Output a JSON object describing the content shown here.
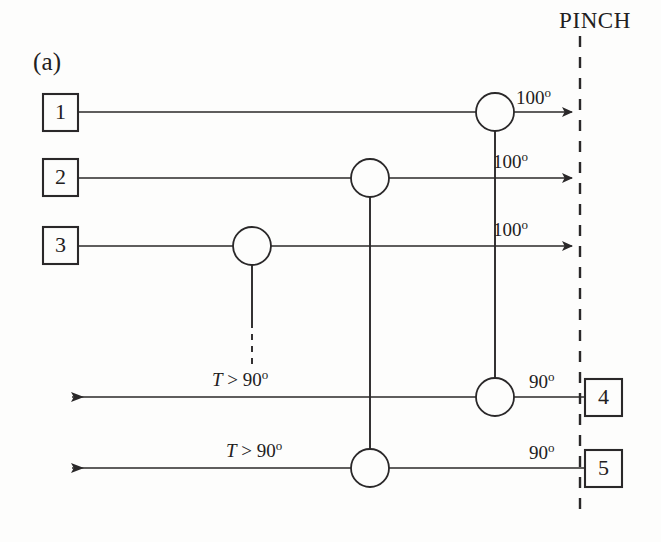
{
  "figure": {
    "panel_label": "(a)",
    "pinch_label": "PINCH",
    "line_color": "#2a2829",
    "background_color": "#fdfdfc"
  },
  "streams": {
    "hot": [
      {
        "id": "stream-1",
        "box_label": "1",
        "outlet_temp": "100",
        "degree_symbol": "o",
        "direction": "right"
      },
      {
        "id": "stream-2",
        "box_label": "2",
        "outlet_temp": "100",
        "degree_symbol": "o",
        "direction": "right"
      },
      {
        "id": "stream-3",
        "box_label": "3",
        "outlet_temp": "100",
        "degree_symbol": "o",
        "direction": "right"
      }
    ],
    "cold": [
      {
        "id": "stream-4",
        "box_label": "4",
        "outlet_temp": "90",
        "degree_symbol": "o",
        "direction": "left"
      },
      {
        "id": "stream-5",
        "box_label": "5",
        "outlet_temp": "90",
        "degree_symbol": "o",
        "direction": "left"
      }
    ]
  },
  "annotations": {
    "condition_upper": {
      "variable": "T",
      "relation": " > ",
      "value": "90",
      "degree_symbol": "o"
    },
    "condition_lower": {
      "variable": "T",
      "relation": " > ",
      "value": "90",
      "degree_symbol": "o"
    }
  },
  "temperature_labels": {
    "t1": "100",
    "t2": "100",
    "t3": "100",
    "t4": "90",
    "t5": "90"
  },
  "box_labels": {
    "b1": "1",
    "b2": "2",
    "b3": "3",
    "b4": "4",
    "b5": "5"
  },
  "exchangers": [
    {
      "name": "exchanger-stream1",
      "on_stream": "1"
    },
    {
      "name": "exchanger-stream2",
      "on_stream": "2"
    },
    {
      "name": "exchanger-stream3",
      "on_stream": "3"
    },
    {
      "name": "exchanger-stream4",
      "on_stream": "4"
    },
    {
      "name": "exchanger-stream5",
      "on_stream": "5"
    }
  ]
}
